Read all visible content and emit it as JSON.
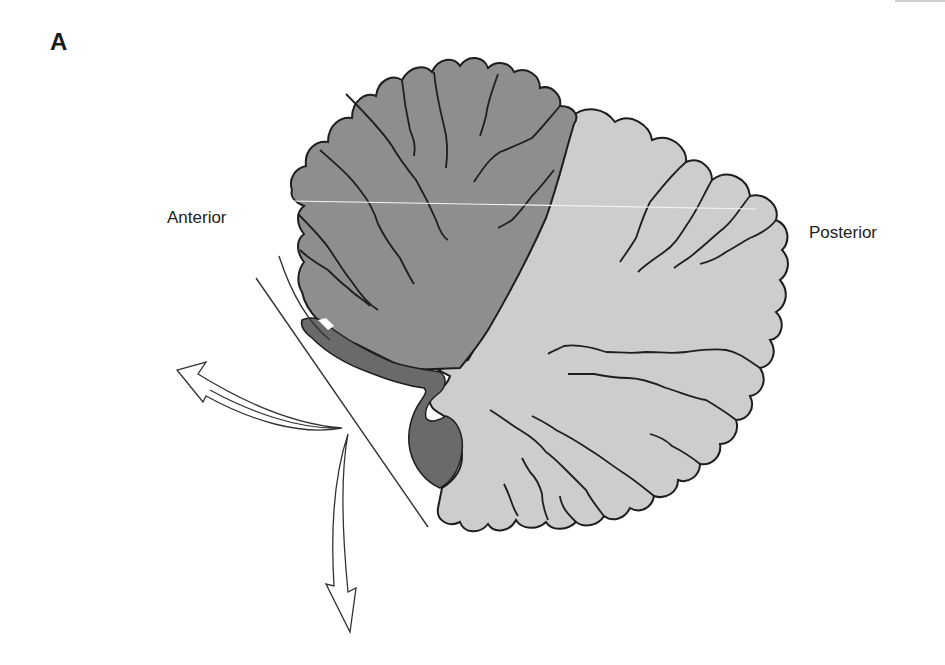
{
  "figure": {
    "panel_label": "A",
    "labels": {
      "anterior": "Anterior",
      "posterior": "Posterior"
    },
    "regions": [
      {
        "name": "anterior-lobe",
        "color": "#8e8e8e"
      },
      {
        "name": "posterior-lobe",
        "color": "#cdcdcd"
      },
      {
        "name": "flocculonodular-lobe",
        "color": "#6a6a6a"
      }
    ],
    "outline_color": "#1e1e1e",
    "arrows": [
      {
        "name": "arrow-up-left"
      },
      {
        "name": "arrow-down"
      }
    ]
  }
}
